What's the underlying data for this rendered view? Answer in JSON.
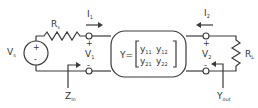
{
  "diagram": {
    "source": {
      "label": "V",
      "sub": "s",
      "plus": "+",
      "minus": "-"
    },
    "source_resistor": {
      "label": "R",
      "sub": "s"
    },
    "load_resistor": {
      "label": "R",
      "sub": "L"
    },
    "port1": {
      "current": {
        "label": "I",
        "sub": "1",
        "direction": "right"
      },
      "voltage": {
        "label": "V",
        "sub": "1",
        "plus": "+",
        "minus": "-"
      },
      "impedance": {
        "label": "Z",
        "sub": "in"
      }
    },
    "port2": {
      "current": {
        "label": "I",
        "sub": "2",
        "direction": "left"
      },
      "voltage": {
        "label": "V",
        "sub": "2",
        "plus": "+",
        "minus": "-"
      },
      "admittance": {
        "label": "Y",
        "sub": "out"
      }
    },
    "network": {
      "prefix": "Y=",
      "matrix": [
        [
          {
            "label": "y",
            "sub": "11"
          },
          {
            "label": "y",
            "sub": "12"
          }
        ],
        [
          {
            "label": "y",
            "sub": "21"
          },
          {
            "label": "y",
            "sub": "22"
          }
        ]
      ]
    },
    "colors": {
      "line": "#3a3a3a",
      "text": "#333333",
      "background": "#ffffff"
    }
  }
}
